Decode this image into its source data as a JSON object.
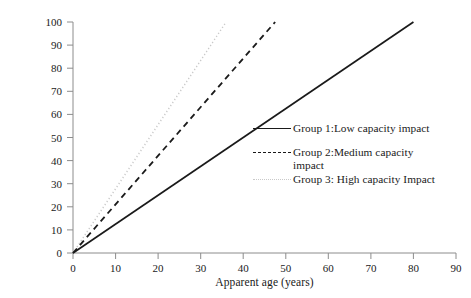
{
  "chart_data": {
    "type": "line",
    "title": "",
    "xlabel": "Apparent age (years)",
    "ylabel": "Demand-capacity ratio (%)",
    "xlim": [
      0,
      90
    ],
    "ylim": [
      0,
      100
    ],
    "xticks": [
      0,
      10,
      20,
      30,
      40,
      50,
      60,
      70,
      80,
      90
    ],
    "yticks": [
      0,
      10,
      20,
      30,
      40,
      50,
      60,
      70,
      80,
      90,
      100
    ],
    "grid": false,
    "legend_position": "center-right",
    "series": [
      {
        "name": "Group 1:Low capacity impact",
        "style": "solid",
        "color": "#1a1a1a",
        "x": [
          0,
          80
        ],
        "values": [
          0,
          100
        ],
        "slope": 1.25
      },
      {
        "name": "Group 2:Medium capacity\nimpact",
        "style": "dashed",
        "color": "#1a1a1a",
        "x": [
          0,
          47.5
        ],
        "values": [
          0,
          100
        ],
        "slope": 2.105
      },
      {
        "name": "Group 3: High capacity Impact",
        "style": "dotted",
        "color": "#c9c9c9",
        "x": [
          0,
          36
        ],
        "values": [
          0,
          100
        ],
        "slope": 2.778
      }
    ]
  },
  "axes": {
    "xlabel": "Apparent age (years)",
    "ylabel": "Demand-capacity ratio (%)",
    "xticklabels": [
      "0",
      "10",
      "20",
      "30",
      "40",
      "50",
      "60",
      "70",
      "80",
      "90"
    ],
    "yticklabels": [
      "0",
      "10",
      "20",
      "30",
      "40",
      "50",
      "60",
      "70",
      "80",
      "90",
      "100"
    ],
    "axis_color": "#8c8c8c"
  },
  "legend": {
    "items": [
      {
        "label": "Group 1:Low capacity impact",
        "style": "solid"
      },
      {
        "label": "Group 2:Medium capacity\nimpact",
        "style": "dashed"
      },
      {
        "label": "Group 3: High capacity Impact",
        "style": "dotted"
      }
    ]
  }
}
